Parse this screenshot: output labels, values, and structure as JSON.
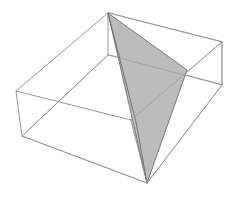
{
  "figure": {
    "kind": "3d-line-drawing",
    "background_color": "#ffffff",
    "canvas": {
      "width": 235,
      "height": 201
    },
    "styles": {
      "wire_stroke_color": "#808080",
      "hidden_wire_stroke_color": "#9a9a9a",
      "plane_fill_color": "#bcbcbc",
      "plane_stroke_color": "#6e6e6e",
      "wire_stroke_width": 0.8,
      "plane_stroke_width": 0.9
    },
    "box": {
      "name": "rectangular-cuboid",
      "vertices": {
        "top_back": [
          108,
          13
        ],
        "top_left": [
          16,
          91
        ],
        "top_right": [
          222,
          42
        ],
        "top_front": [
          131,
          120
        ],
        "bottom_back": [
          108,
          55
        ],
        "bottom_left": [
          22,
          136
        ],
        "bottom_right": [
          222,
          85
        ],
        "bottom_front": [
          147,
          183
        ]
      },
      "top_face_path": "108,13 16,91 131,120 222,42",
      "bottom_face_path": "108,55 22,136 147,183 222,85",
      "vertical_edges": [
        [
          [
            108,
            13
          ],
          [
            108,
            55
          ]
        ],
        [
          [
            16,
            91
          ],
          [
            22,
            136
          ]
        ],
        [
          [
            222,
            42
          ],
          [
            222,
            85
          ]
        ],
        [
          [
            131,
            120
          ],
          [
            147,
            183
          ]
        ]
      ]
    },
    "plane": {
      "name": "shaded-triangular-cross-section",
      "fill": "#bcbcbc",
      "vertices": [
        [
          108,
          13
        ],
        [
          187,
          70
        ],
        [
          147,
          183
        ]
      ],
      "polygon_points": "108,13 187,70 147,183"
    },
    "extra_edges": [
      {
        "name": "plane-box-intersection-left",
        "points": [
          [
            108,
            13
          ],
          [
            136,
            122
          ]
        ]
      },
      {
        "name": "plane-box-intersection-lower",
        "points": [
          [
            136,
            122
          ],
          [
            147,
            183
          ]
        ]
      }
    ]
  }
}
